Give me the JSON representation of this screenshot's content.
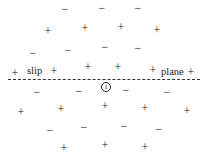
{
  "diagram": {
    "plane_labels": {
      "left": "slip",
      "right": "plane"
    },
    "marker": {
      "label": "1",
      "x": 106,
      "y": 87
    },
    "line_style": "dashed",
    "symbols": [
      {
        "s": "−",
        "x": 65,
        "y": 9
      },
      {
        "s": "−",
        "x": 102,
        "y": 8
      },
      {
        "s": "−",
        "x": 138,
        "y": 8
      },
      {
        "s": "+",
        "x": 48,
        "y": 31
      },
      {
        "s": "+",
        "x": 85,
        "y": 28
      },
      {
        "s": "+",
        "x": 121,
        "y": 27
      },
      {
        "s": "+",
        "x": 157,
        "y": 30
      },
      {
        "s": "−",
        "x": 33,
        "y": 53
      },
      {
        "s": "−",
        "x": 68,
        "y": 50
      },
      {
        "s": "−",
        "x": 105,
        "y": 47
      },
      {
        "s": "−",
        "x": 138,
        "y": 48
      },
      {
        "s": "+",
        "x": 15,
        "y": 73
      },
      {
        "s": "+",
        "x": 54,
        "y": 71
      },
      {
        "s": "+",
        "x": 88,
        "y": 67
      },
      {
        "s": "+",
        "x": 118,
        "y": 67
      },
      {
        "s": "+",
        "x": 153,
        "y": 70
      },
      {
        "s": "+",
        "x": 191,
        "y": 72
      },
      {
        "s": "−",
        "x": 37,
        "y": 92
      },
      {
        "s": "−",
        "x": 79,
        "y": 91
      },
      {
        "s": "−",
        "x": 126,
        "y": 90
      },
      {
        "s": "−",
        "x": 167,
        "y": 92
      },
      {
        "s": "+",
        "x": 21,
        "y": 112
      },
      {
        "s": "+",
        "x": 61,
        "y": 109
      },
      {
        "s": "+",
        "x": 105,
        "y": 106
      },
      {
        "s": "+",
        "x": 145,
        "y": 108
      },
      {
        "s": "+",
        "x": 187,
        "y": 111
      },
      {
        "s": "−",
        "x": 50,
        "y": 130
      },
      {
        "s": "−",
        "x": 84,
        "y": 127
      },
      {
        "s": "−",
        "x": 124,
        "y": 126
      },
      {
        "s": "−",
        "x": 159,
        "y": 129
      },
      {
        "s": "+",
        "x": 64,
        "y": 148
      },
      {
        "s": "+",
        "x": 105,
        "y": 145
      },
      {
        "s": "+",
        "x": 145,
        "y": 147
      }
    ]
  }
}
